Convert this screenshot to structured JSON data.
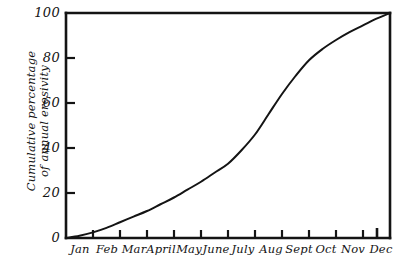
{
  "figure": {
    "title": "",
    "background_color": "#ffffff",
    "ink_color": "#141414"
  },
  "axes": {
    "y_title_line1": "Cumulative percentage",
    "y_title_line2": "of annual erosivity",
    "x_title": ""
  },
  "chart_data": {
    "type": "line",
    "title": "",
    "subtitle": "",
    "xlabel": "",
    "ylabel": "Cumulative percentage of annual erosivity",
    "ylim": [
      0,
      100
    ],
    "xlim": [
      0,
      12
    ],
    "grid": false,
    "legend": false,
    "legend_position": "none",
    "y_ticks": [
      0,
      20,
      40,
      60,
      80,
      100
    ],
    "y_tick_labels": [
      "0",
      "20",
      "40",
      "60",
      "80",
      "100"
    ],
    "x_tick_count": 13,
    "categories": [
      "Jan",
      "Feb",
      "Mar",
      "April",
      "May",
      "June",
      "July",
      "Aug",
      "Sept",
      "Oct",
      "Nov",
      "Dec"
    ],
    "x_tick_labels": [
      "Jan",
      "Feb",
      "Mar",
      "April",
      "May",
      "June",
      "July",
      "Aug",
      "Sept",
      "Oct",
      "Nov",
      "Dec"
    ],
    "series": [
      {
        "name": "Cumulative erosivity",
        "color": "#141414",
        "line_width": 2,
        "x": [
          0,
          0.5,
          1,
          1.5,
          2,
          2.5,
          3,
          3.5,
          4,
          4.5,
          5,
          5.5,
          6,
          6.5,
          7,
          7.5,
          8,
          8.5,
          9,
          9.5,
          10,
          10.5,
          11,
          11.5,
          12
        ],
        "x_month_labels": [
          "start Jan",
          "mid Jan",
          "start Feb",
          "mid Feb",
          "start Mar",
          "mid Mar",
          "start April",
          "mid April",
          "start May",
          "mid May",
          "start June",
          "mid June",
          "start July",
          "mid July",
          "start Aug",
          "mid Aug",
          "start Sept",
          "mid Sept",
          "start Oct",
          "mid Oct",
          "start Nov",
          "mid Nov",
          "start Dec",
          "mid Dec",
          "end Dec"
        ],
        "values": [
          0,
          1,
          2.5,
          4.5,
          7,
          9.5,
          12,
          15,
          18,
          21.5,
          25,
          29,
          33,
          39,
          46,
          55,
          64,
          72,
          79,
          84,
          88,
          91.5,
          94.5,
          97.5,
          100
        ]
      }
    ],
    "annotations": []
  }
}
